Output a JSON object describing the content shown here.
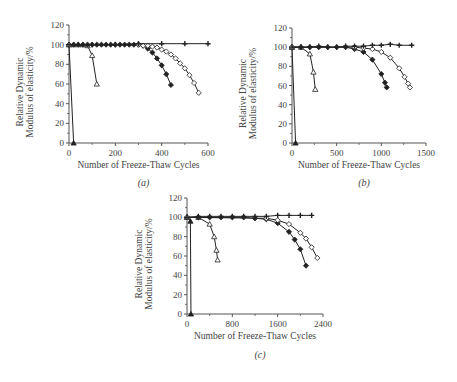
{
  "figure": {
    "panel_labels": [
      "(a)",
      "(b)",
      "(c)"
    ],
    "xlabel": "Number of Freeze-Thaw Cycles",
    "ylabel_line1": "Relative Dynamic",
    "ylabel_line2": "Modulus of elasticity/%"
  },
  "chart_data": [
    {
      "type": "line",
      "panel": "(a)",
      "title": "",
      "xlabel": "Number of Freeze-Thaw Cycles",
      "ylabel": "Relative Dynamic Modulus of elasticity/%",
      "xlim": [
        0,
        600
      ],
      "ylim": [
        0,
        120
      ],
      "xticks": [
        0,
        200,
        400,
        600
      ],
      "yticks": [
        0,
        20,
        40,
        60,
        80,
        100,
        120
      ],
      "grid": false,
      "legend": null,
      "series": [
        {
          "name": "solid-triangle",
          "marker": "triangle-filled",
          "x": [
            0,
            20
          ],
          "y": [
            100,
            0
          ]
        },
        {
          "name": "open-triangle",
          "marker": "triangle-open",
          "x": [
            0,
            20,
            40,
            60,
            80,
            100,
            120
          ],
          "y": [
            100,
            100,
            100,
            100,
            99,
            89,
            60
          ]
        },
        {
          "name": "solid-diamond",
          "marker": "diamond-filled",
          "x": [
            0,
            20,
            40,
            60,
            80,
            100,
            120,
            140,
            160,
            180,
            200,
            220,
            240,
            260,
            280,
            300,
            320,
            340,
            360,
            380,
            400,
            420,
            440
          ],
          "y": [
            100,
            100,
            100,
            100,
            100,
            100,
            100,
            100,
            100,
            100,
            100,
            100,
            100,
            100,
            100,
            100,
            99,
            96,
            92,
            86,
            79,
            70,
            59
          ]
        },
        {
          "name": "open-diamond",
          "marker": "diamond-open",
          "x": [
            0,
            300,
            320,
            340,
            360,
            380,
            400,
            420,
            440,
            460,
            480,
            500,
            520,
            540,
            560
          ],
          "y": [
            100,
            100,
            99,
            99,
            98,
            97,
            95,
            93,
            90,
            86,
            81,
            76,
            69,
            61,
            51
          ]
        },
        {
          "name": "plus",
          "marker": "plus",
          "x": [
            0,
            100,
            200,
            300,
            400,
            500,
            600
          ],
          "y": [
            100,
            100,
            100,
            101,
            101,
            101,
            101
          ]
        }
      ]
    },
    {
      "type": "line",
      "panel": "(b)",
      "title": "",
      "xlabel": "Number of Freeze-Thaw Cycles",
      "ylabel": "Relative Dynamic Modulus of elasticity/%",
      "xlim": [
        0,
        1500
      ],
      "ylim": [
        0,
        120
      ],
      "xticks": [
        0,
        500,
        1000,
        1500
      ],
      "yticks": [
        0,
        20,
        40,
        60,
        80,
        100,
        120
      ],
      "grid": false,
      "legend": null,
      "series": [
        {
          "name": "solid-triangle",
          "marker": "triangle-filled",
          "x": [
            0,
            40
          ],
          "y": [
            100,
            0
          ]
        },
        {
          "name": "open-triangle",
          "marker": "triangle-open",
          "x": [
            0,
            100,
            200,
            240,
            260
          ],
          "y": [
            100,
            100,
            93,
            74,
            56
          ]
        },
        {
          "name": "solid-diamond",
          "marker": "diamond-filled",
          "x": [
            0,
            100,
            200,
            300,
            400,
            500,
            600,
            700,
            800,
            900,
            1000,
            1040,
            1060
          ],
          "y": [
            100,
            100,
            100,
            100,
            100,
            100,
            100,
            98,
            95,
            87,
            72,
            63,
            58
          ]
        },
        {
          "name": "open-diamond",
          "marker": "diamond-open",
          "x": [
            0,
            700,
            800,
            900,
            1000,
            1100,
            1200,
            1260,
            1300,
            1320
          ],
          "y": [
            100,
            100,
            99,
            98,
            95,
            89,
            78,
            69,
            62,
            58
          ]
        },
        {
          "name": "plus",
          "marker": "plus",
          "x": [
            0,
            100,
            200,
            300,
            400,
            500,
            600,
            700,
            800,
            900,
            1000,
            1100,
            1200,
            1340
          ],
          "y": [
            100,
            100,
            100,
            101,
            100,
            100,
            101,
            101,
            101,
            102,
            102,
            103,
            102,
            102
          ]
        }
      ]
    },
    {
      "type": "line",
      "panel": "(c)",
      "title": "",
      "xlabel": "Number of Freeze-Thaw Cycles",
      "ylabel": "Relative Dynamic Modulus of elasticity/%",
      "xlim": [
        0,
        2400
      ],
      "ylim": [
        0,
        120
      ],
      "xticks": [
        0,
        800,
        1600,
        2400
      ],
      "yticks": [
        0,
        20,
        40,
        60,
        80,
        100,
        120
      ],
      "grid": false,
      "legend": null,
      "series": [
        {
          "name": "solid-triangle",
          "marker": "triangle-filled",
          "x": [
            0,
            60,
            70
          ],
          "y": [
            100,
            96,
            0
          ]
        },
        {
          "name": "open-triangle",
          "marker": "triangle-open",
          "x": [
            0,
            200,
            400,
            480,
            520,
            540
          ],
          "y": [
            100,
            100,
            93,
            80,
            66,
            56
          ]
        },
        {
          "name": "solid-diamond",
          "marker": "diamond-filled",
          "x": [
            0,
            200,
            400,
            600,
            800,
            1000,
            1200,
            1400,
            1600,
            1800,
            1900,
            2000,
            2100
          ],
          "y": [
            100,
            100,
            100,
            100,
            100,
            100,
            99,
            98,
            94,
            85,
            77,
            67,
            50
          ]
        },
        {
          "name": "open-diamond",
          "marker": "diamond-open",
          "x": [
            0,
            1400,
            1600,
            1800,
            2000,
            2100,
            2200,
            2300
          ],
          "y": [
            100,
            99,
            97,
            93,
            84,
            78,
            69,
            58
          ]
        },
        {
          "name": "plus",
          "marker": "plus",
          "x": [
            0,
            200,
            400,
            600,
            800,
            1000,
            1200,
            1400,
            1600,
            1800,
            2000,
            2200
          ],
          "y": [
            100,
            101,
            101,
            101,
            101,
            101,
            101,
            101,
            102,
            102,
            102,
            102
          ]
        }
      ]
    }
  ]
}
